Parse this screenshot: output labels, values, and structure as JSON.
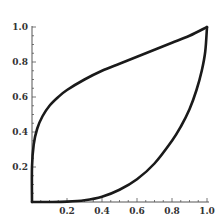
{
  "chart_data": {
    "type": "line",
    "title": "",
    "xlabel": "",
    "ylabel": "",
    "xlim": [
      0,
      1
    ],
    "ylim": [
      0,
      1
    ],
    "grid": false,
    "legend": null,
    "x_ticks": [
      "0.2",
      "0.4",
      "0.6",
      "0.8",
      "1.0"
    ],
    "y_ticks": [
      "0.2",
      "0.4",
      "0.6",
      "0.8",
      "1.0"
    ],
    "series": [
      {
        "name": "upper curve",
        "x": [
          0,
          0.0,
          0.01,
          0.03,
          0.06,
          0.1,
          0.15,
          0.2,
          0.3,
          0.4,
          0.5,
          0.6,
          0.7,
          0.8,
          0.9,
          1.0
        ],
        "y": [
          0,
          0.2,
          0.33,
          0.42,
          0.49,
          0.55,
          0.6,
          0.64,
          0.7,
          0.75,
          0.79,
          0.83,
          0.87,
          0.91,
          0.95,
          1.0
        ]
      },
      {
        "name": "lower curve",
        "x": [
          0,
          0.1,
          0.2,
          0.3,
          0.4,
          0.5,
          0.6,
          0.7,
          0.8,
          0.85,
          0.9,
          0.94,
          0.97,
          0.99,
          1.0
        ],
        "y": [
          0,
          0.0,
          0.002,
          0.01,
          0.03,
          0.07,
          0.13,
          0.22,
          0.35,
          0.43,
          0.53,
          0.64,
          0.75,
          0.86,
          1.0
        ]
      }
    ],
    "colors": {
      "curve": "#1a1a1a",
      "axis": "#555555"
    }
  }
}
